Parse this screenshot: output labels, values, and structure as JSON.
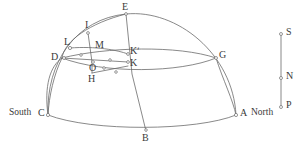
{
  "figure": {
    "kind": "celestial-sphere-diagram",
    "stroke_color": "#6b6b6b",
    "label_color": "#3a3a3a",
    "background": "#ffffff",
    "width": 301,
    "height": 152
  },
  "labels": {
    "E": "E",
    "I": "I",
    "L": "L",
    "M": "M",
    "D": "D",
    "Kprime": "Kʹ",
    "K": "K",
    "O": "O",
    "G": "G",
    "H": "H",
    "C": "C",
    "A": "A",
    "B": "B",
    "S": "S",
    "N": "N",
    "P": "P",
    "south": "South",
    "north": "North"
  },
  "points": {
    "E": {
      "x": 126,
      "y": 14,
      "label_dx": -4,
      "label_dy": -12
    },
    "I": {
      "x": 88,
      "y": 32,
      "label_dx": -4,
      "label_dy": -12
    },
    "L": {
      "x": 70,
      "y": 48,
      "label_dx": -5,
      "label_dy": -11
    },
    "M": {
      "x": 92,
      "y": 47,
      "label_dx": 4,
      "label_dy": -5
    },
    "D": {
      "x": 62,
      "y": 58,
      "label_dx": -12,
      "label_dy": -4
    },
    "Kp": {
      "x": 128,
      "y": 54,
      "label_dx": 4,
      "label_dy": -5
    },
    "K": {
      "x": 128,
      "y": 62,
      "label_dx": 4,
      "label_dy": 4
    },
    "O": {
      "x": 95,
      "y": 62,
      "label_dx": -3,
      "label_dy": 4
    },
    "G": {
      "x": 216,
      "y": 58,
      "label_dx": 4,
      "label_dy": -4
    },
    "H": {
      "x": 92,
      "y": 73,
      "label_dx": -3,
      "label_dy": 10
    },
    "C": {
      "x": 48,
      "y": 115,
      "label_dx": -10,
      "label_dy": -1
    },
    "A": {
      "x": 236,
      "y": 115,
      "label_dx": 5,
      "label_dy": -1
    },
    "B": {
      "x": 146,
      "y": 131,
      "label_dx": -2,
      "label_dy": 9
    },
    "S": {
      "x": 281,
      "y": 33,
      "label_dx": 5,
      "label_dy": -1
    },
    "N": {
      "x": 281,
      "y": 78,
      "label_dx": 5,
      "label_dy": -1
    },
    "P": {
      "x": 281,
      "y": 107,
      "label_dx": 5,
      "label_dy": -1
    }
  },
  "word_labels": {
    "south": {
      "x": 10,
      "y": 110
    },
    "north": {
      "x": 249,
      "y": 110
    }
  },
  "tick_marks": [
    {
      "x": 80,
      "y": 55
    },
    {
      "x": 110,
      "y": 60
    },
    {
      "x": 103,
      "y": 67
    },
    {
      "x": 115,
      "y": 72
    }
  ],
  "curves": {
    "dome_outline": "M 48 115 C 46 60, 78 18, 126 14 C 176 10, 232 52, 236 115",
    "horizon_front": "M 48 115 C 90 131, 196 131, 236 115",
    "equator_arc": "M 62 58 C 110 76, 178 74, 216 58",
    "equator_back": "M 62 58 C 108 45, 176 44, 216 58",
    "meridian_EB": "M 126 14 L 146 131",
    "small_circle_upper": "M 62 58 C 64 40, 92 22, 126 14",
    "small_circle_lower": "M 48 115 C 44 84, 52 64, 62 58",
    "ecliptic_arc_LK": "M 70 48 C 98 46, 118 50, 128 54",
    "dk_line": "M 62 58 L 128 62",
    "h_line": "M 92 73 L 128 66",
    "im_line": "M 88 32 L 92 62",
    "g_drop": "M 216 58 C 222 80, 232 100, 236 115",
    "b_drop": "M 146 131 C 142 120, 136 98, 132 74"
  },
  "right_axis": {
    "line": {
      "x": 281,
      "y1": 33,
      "y2": 107
    }
  }
}
